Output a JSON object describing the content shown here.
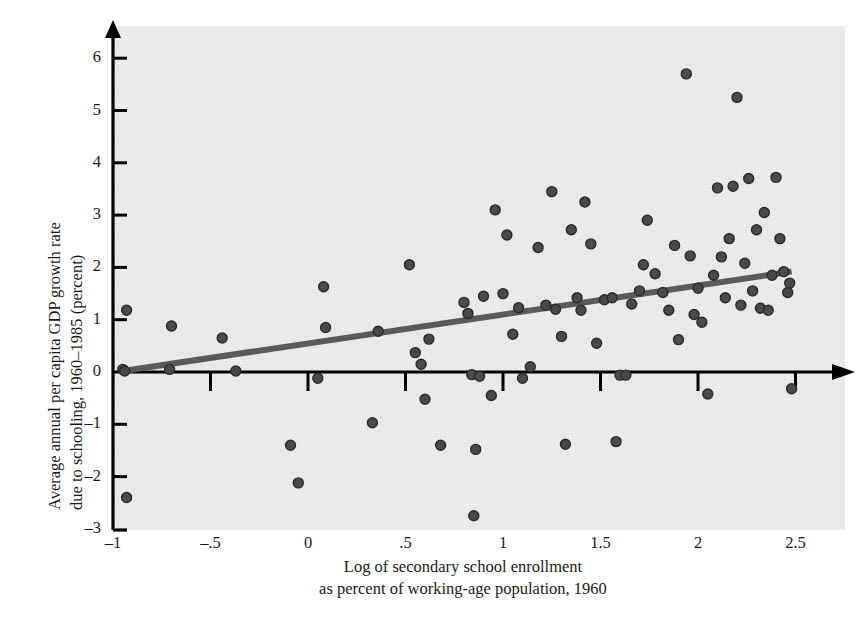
{
  "chart_data": {
    "type": "scatter",
    "title": "",
    "xlabel_line1": "Log of secondary school enrollment",
    "xlabel_line2": "as percent of working-age population, 1960",
    "ylabel_line1": "Average annual per capita GDP growth rate",
    "ylabel_line2": "due to schooling, 1960–1985 (percent)",
    "xlim": [
      -1.15,
      2.72
    ],
    "ylim": [
      -3.0,
      6.45
    ],
    "xticks": [
      -1,
      -0.5,
      0,
      0.5,
      1,
      1.5,
      2,
      2.5
    ],
    "xtick_labels": [
      "–1",
      "–.5",
      "0",
      ".5",
      "1",
      "1.5",
      "2",
      "2.5"
    ],
    "yticks": [
      -3,
      -2,
      -1,
      0,
      1,
      2,
      3,
      4,
      5,
      6
    ],
    "ytick_labels": [
      "–3",
      "–2",
      "–1",
      "0",
      "1",
      "2",
      "3",
      "4",
      "5",
      "6"
    ],
    "grid": false,
    "legend": null,
    "plot_bg_color": "#e8e8e8",
    "point_color": "#4a4a4a",
    "point_edge_color": "#2b2b2b",
    "line_color": "#5a5a5a",
    "axis_color": "#000000",
    "point_radius": 5,
    "trendline": {
      "name": "fitted regression line",
      "x": [
        -0.95,
        2.48
      ],
      "y": [
        0.02,
        1.92
      ]
    },
    "series": [
      {
        "name": "countries",
        "points": [
          [
            -0.93,
            1.18
          ],
          [
            -0.93,
            -2.4
          ],
          [
            -0.95,
            0.05
          ],
          [
            -0.94,
            0.02
          ],
          [
            -0.7,
            0.88
          ],
          [
            -0.71,
            0.05
          ],
          [
            -0.44,
            0.65
          ],
          [
            -0.37,
            0.02
          ],
          [
            -0.09,
            -1.4
          ],
          [
            -0.05,
            -2.12
          ],
          [
            0.05,
            -0.12
          ],
          [
            0.08,
            1.63
          ],
          [
            0.09,
            0.85
          ],
          [
            0.33,
            -0.97
          ],
          [
            0.36,
            0.78
          ],
          [
            0.52,
            2.05
          ],
          [
            0.55,
            0.37
          ],
          [
            0.58,
            0.15
          ],
          [
            0.6,
            -0.52
          ],
          [
            0.62,
            0.63
          ],
          [
            0.68,
            -1.4
          ],
          [
            0.8,
            1.33
          ],
          [
            0.82,
            1.12
          ],
          [
            0.84,
            -0.05
          ],
          [
            0.85,
            -2.75
          ],
          [
            0.86,
            -1.48
          ],
          [
            0.88,
            -0.08
          ],
          [
            0.9,
            1.45
          ],
          [
            0.94,
            -0.45
          ],
          [
            0.96,
            3.1
          ],
          [
            1.0,
            1.5
          ],
          [
            1.02,
            2.62
          ],
          [
            1.05,
            0.72
          ],
          [
            1.08,
            1.23
          ],
          [
            1.1,
            -0.12
          ],
          [
            1.14,
            0.1
          ],
          [
            1.18,
            2.38
          ],
          [
            1.22,
            1.28
          ],
          [
            1.25,
            3.45
          ],
          [
            1.27,
            1.2
          ],
          [
            1.3,
            0.68
          ],
          [
            1.32,
            -1.38
          ],
          [
            1.35,
            2.72
          ],
          [
            1.38,
            1.42
          ],
          [
            1.4,
            1.18
          ],
          [
            1.42,
            3.25
          ],
          [
            1.45,
            2.45
          ],
          [
            1.48,
            0.55
          ],
          [
            1.52,
            1.38
          ],
          [
            1.56,
            1.42
          ],
          [
            1.58,
            -1.33
          ],
          [
            1.6,
            -0.06
          ],
          [
            1.63,
            -0.06
          ],
          [
            1.66,
            1.3
          ],
          [
            1.7,
            1.55
          ],
          [
            1.72,
            2.05
          ],
          [
            1.74,
            2.9
          ],
          [
            1.78,
            1.88
          ],
          [
            1.82,
            1.52
          ],
          [
            1.85,
            1.18
          ],
          [
            1.88,
            2.42
          ],
          [
            1.9,
            0.62
          ],
          [
            1.94,
            5.7
          ],
          [
            1.96,
            2.22
          ],
          [
            1.98,
            1.1
          ],
          [
            2.0,
            1.6
          ],
          [
            2.02,
            0.95
          ],
          [
            2.05,
            -0.42
          ],
          [
            2.08,
            1.85
          ],
          [
            2.1,
            3.52
          ],
          [
            2.12,
            2.2
          ],
          [
            2.14,
            1.42
          ],
          [
            2.16,
            2.55
          ],
          [
            2.18,
            3.55
          ],
          [
            2.2,
            5.25
          ],
          [
            2.22,
            1.28
          ],
          [
            2.24,
            2.08
          ],
          [
            2.26,
            3.7
          ],
          [
            2.28,
            1.55
          ],
          [
            2.3,
            2.72
          ],
          [
            2.32,
            1.22
          ],
          [
            2.34,
            3.05
          ],
          [
            2.36,
            1.18
          ],
          [
            2.38,
            1.85
          ],
          [
            2.4,
            3.72
          ],
          [
            2.42,
            2.55
          ],
          [
            2.44,
            1.92
          ],
          [
            2.46,
            1.52
          ],
          [
            2.47,
            1.7
          ],
          [
            2.48,
            -0.32
          ]
        ]
      }
    ]
  }
}
